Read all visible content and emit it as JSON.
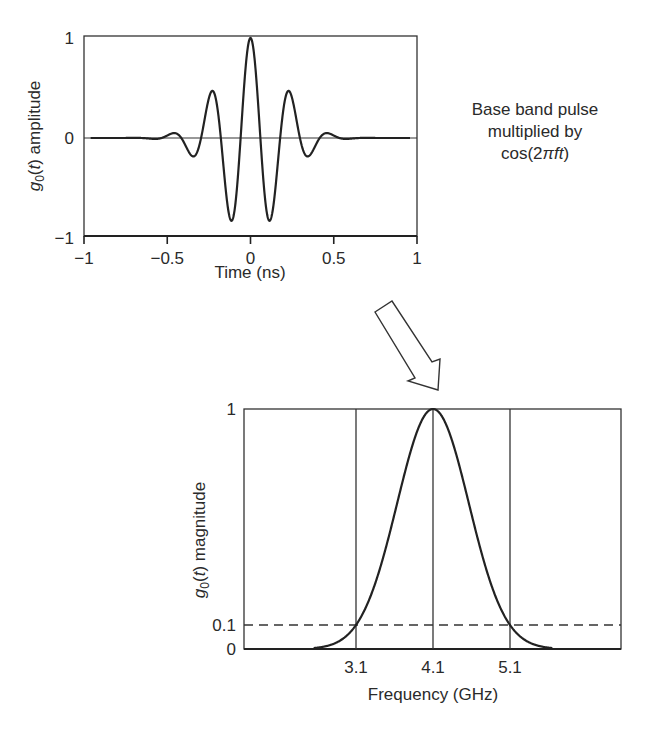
{
  "chart_data": [
    {
      "type": "line",
      "title": "",
      "xlabel": "Time (ns)",
      "ylabel": "g0(t) amplitude",
      "ylabel_parts": {
        "g": "g",
        "sub": "0",
        "rest": "(t) amplitude"
      },
      "xlim": [
        -1,
        1
      ],
      "ylim": [
        -1,
        1
      ],
      "x_ticks": [
        "-1",
        "-0.5",
        "0",
        "0.5",
        "1"
      ],
      "x_tick_values": [
        -1,
        -0.5,
        0,
        0.5,
        1
      ],
      "y_ticks": [
        "-1",
        "0",
        "1"
      ],
      "y_tick_values": [
        -1,
        0,
        1
      ],
      "grid": false,
      "zero_line": true,
      "description": "Gaussian-modulated cosine (baseband pulse multiplied by cos(2*pi*f*t)), peak 1 at t=0",
      "series": [
        {
          "name": "g0(t)",
          "x": [
            -0.96,
            -0.72,
            -0.59,
            -0.47,
            -0.35,
            -0.235,
            -0.12,
            0,
            0.12,
            0.235,
            0.35,
            0.47,
            0.59,
            0.72,
            0.96
          ],
          "values": [
            0,
            0.01,
            -0.05,
            0.12,
            -0.34,
            0.6,
            -0.93,
            1.0,
            -0.93,
            0.6,
            -0.34,
            0.12,
            -0.05,
            0.01,
            0
          ]
        }
      ],
      "model": {
        "carrier_period_ns": 0.2375,
        "gaussian_sigma_ns": 0.19
      }
    },
    {
      "type": "line",
      "title": "",
      "xlabel": "Frequency (GHz)",
      "ylabel": "g0(t) magnitude",
      "ylabel_parts": {
        "g": "g",
        "sub": "0",
        "rest": "(t) magnitude"
      },
      "x_ticks": [
        "3.1",
        "4.1",
        "5.1"
      ],
      "x_tick_values": [
        3.1,
        4.1,
        5.1
      ],
      "y_ticks": [
        "0",
        "0.1",
        "1"
      ],
      "y_tick_values": [
        0,
        0.1,
        1
      ],
      "ylim": [
        0,
        1
      ],
      "grid": false,
      "reference_lines": {
        "vertical": [
          3.1,
          4.1,
          5.1
        ],
        "horizontal_dashed": 0.1
      },
      "description": "Gaussian magnitude spectrum centered at 4.1 GHz, -10 dB (0.1) bandwidth from 3.1 to 5.1 GHz",
      "series": [
        {
          "name": "|G0(f)|",
          "x": [
            2.4,
            2.8,
            3.1,
            3.4,
            3.7,
            4.1,
            4.5,
            4.8,
            5.1,
            5.4,
            5.8
          ],
          "values": [
            0.0,
            0.02,
            0.1,
            0.31,
            0.66,
            1.0,
            0.66,
            0.31,
            0.1,
            0.02,
            0.0
          ]
        }
      ]
    }
  ],
  "annotation": {
    "line1": "Base band pulse",
    "line2": "multiplied by",
    "line3_prefix": "cos(2",
    "line3_pi": "π",
    "line3_ft": "ft",
    "line3_suffix": ")"
  },
  "arrow": {
    "icon": "hollow-arrow-down-right",
    "meaning": "transform to frequency domain"
  }
}
